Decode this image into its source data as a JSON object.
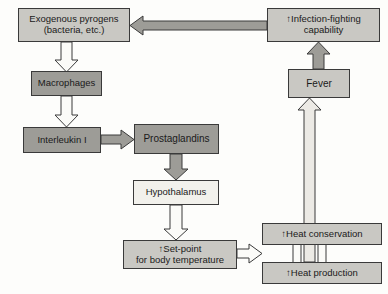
{
  "diagram": {
    "background_color": "#fdfdfb",
    "outline_color": "#3a3a3a",
    "fills": {
      "light": "#f2f1ec",
      "medium": "#c9c8c3",
      "dark": "#9d9c97"
    },
    "nodes": [
      {
        "id": "exogenous-pyrogens",
        "label": "Exogenous pyrogens\n(bacteria, etc.)",
        "fill": "medium",
        "x": 18,
        "y": 8,
        "w": 112,
        "h": 34,
        "font_size": 9.5
      },
      {
        "id": "macrophages",
        "label": "Macrophages",
        "fill": "dark",
        "x": 31,
        "y": 71,
        "w": 71,
        "h": 25,
        "font_size": 9.5
      },
      {
        "id": "interleukin-1",
        "label": "Interleukin I",
        "fill": "dark",
        "x": 23,
        "y": 127,
        "w": 78,
        "h": 26,
        "font_size": 9.5
      },
      {
        "id": "prostaglandins",
        "label": "Prostaglandins",
        "fill": "dark",
        "x": 134,
        "y": 124,
        "w": 85,
        "h": 30,
        "font_size": 10
      },
      {
        "id": "hypothalamus",
        "label": "Hypothalamus",
        "fill": "light",
        "x": 133,
        "y": 180,
        "w": 86,
        "h": 25,
        "font_size": 9.5
      },
      {
        "id": "set-point",
        "label": "↑Set-point\nfor body temperature",
        "fill": "medium",
        "x": 123,
        "y": 240,
        "w": 114,
        "h": 29,
        "font_size": 9.5
      },
      {
        "id": "heat-conservation",
        "label": "↑Heat conservation",
        "fill": "medium",
        "x": 262,
        "y": 223,
        "w": 120,
        "h": 22,
        "font_size": 9.5
      },
      {
        "id": "heat-production",
        "label": "↑Heat production",
        "fill": "medium",
        "x": 262,
        "y": 262,
        "w": 120,
        "h": 22,
        "font_size": 9.5
      },
      {
        "id": "fever",
        "label": "Fever",
        "fill": "medium",
        "x": 288,
        "y": 69,
        "w": 62,
        "h": 29,
        "font_size": 10
      },
      {
        "id": "infection-fighting",
        "label": "↑Infection-fighting\ncapability",
        "fill": "medium",
        "x": 267,
        "y": 8,
        "w": 113,
        "h": 34,
        "font_size": 9.5
      }
    ],
    "connectors": [
      {
        "id": "pyrogens-to-macrophages",
        "from": "exogenous-pyrogens",
        "to": "macrophages",
        "style": "hollow",
        "direction": "down"
      },
      {
        "id": "macrophages-to-interleukin",
        "from": "macrophages",
        "to": "interleukin-1",
        "style": "hollow",
        "direction": "down"
      },
      {
        "id": "interleukin-to-prostaglandins",
        "from": "interleukin-1",
        "to": "prostaglandins",
        "style": "filled",
        "direction": "right"
      },
      {
        "id": "prostaglandins-to-hypothalamus",
        "from": "prostaglandins",
        "to": "hypothalamus",
        "style": "filled",
        "direction": "down"
      },
      {
        "id": "hypothalamus-to-setpoint",
        "from": "hypothalamus",
        "to": "set-point",
        "style": "hollow",
        "direction": "down"
      },
      {
        "id": "setpoint-to-heat",
        "from": "set-point",
        "to": "heat-conservation",
        "style": "hollow",
        "direction": "right"
      },
      {
        "id": "heat-to-fever",
        "from": "heat-production",
        "to": "fever",
        "style": "hollow",
        "direction": "up"
      },
      {
        "id": "fever-to-infection-fighting",
        "from": "fever",
        "to": "infection-fighting",
        "style": "filled",
        "direction": "up"
      },
      {
        "id": "infection-fighting-to-pyrogens",
        "from": "infection-fighting",
        "to": "exogenous-pyrogens",
        "style": "filled",
        "direction": "left"
      }
    ]
  }
}
